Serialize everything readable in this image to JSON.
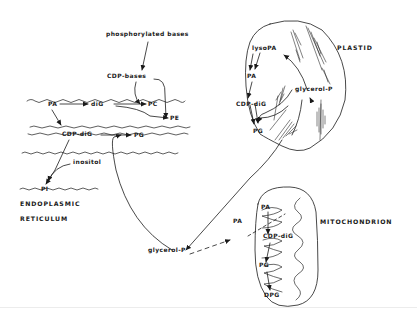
{
  "diagram": {
    "type": "biochemical pathway diagram",
    "compartments": {
      "er": {
        "label_line1": "ENDOPLASMIC",
        "label_line2": "RETICULUM"
      },
      "plastid": {
        "label": "PLASTID"
      },
      "mitochondrion": {
        "label": "MITOCHONDRION"
      }
    },
    "nodes": {
      "phosphorylated_bases": "phosphorylated bases",
      "cdp_bases": "CDP-bases",
      "er_pa": "PA",
      "er_dig": "diG",
      "er_pc": "PC",
      "er_pe": "PE",
      "er_cdp_dig": "CDP-diG",
      "er_pg": "PG",
      "inositol": "inositol",
      "er_pi": "PI",
      "plastid_lysopa": "lysoPA",
      "plastid_pa": "PA",
      "plastid_cdp_dig": "CDP-diG",
      "plastid_glycerol_p": "glycerol-P",
      "plastid_pg": "PG",
      "cyto_glycerol_p": "glycerol-P",
      "cyto_pa": "PA",
      "mito_pa": "PA",
      "mito_cdp_dig": "CDP-diG",
      "mito_pg": "PG",
      "mito_dpg": "DPG"
    },
    "edges": [
      {
        "from": "phosphorylated bases",
        "to": "CDP-bases"
      },
      {
        "from": "CDP-bases",
        "to": "PC"
      },
      {
        "from": "CDP-bases",
        "to": "PE"
      },
      {
        "from": "PA",
        "to": "diG",
        "compartment": "ER"
      },
      {
        "from": "diG",
        "to": "PC",
        "compartment": "ER"
      },
      {
        "from": "diG",
        "to": "PE",
        "compartment": "ER"
      },
      {
        "from": "PA",
        "to": "CDP-diG",
        "compartment": "ER"
      },
      {
        "from": "CDP-diG",
        "to": "PG",
        "compartment": "ER"
      },
      {
        "from": "CDP-diG",
        "to": "PI",
        "compartment": "ER"
      },
      {
        "from": "inositol",
        "to": "PI",
        "compartment": "ER"
      },
      {
        "from": "glycerol-P",
        "to": "PG",
        "compartment": "ER"
      },
      {
        "from": "lysoPA",
        "to": "PA",
        "compartment": "plastid"
      },
      {
        "from": "PA",
        "to": "CDP-diG",
        "compartment": "plastid"
      },
      {
        "from": "CDP-diG",
        "to": "PG",
        "compartment": "plastid"
      },
      {
        "from": "glycerol-P",
        "to": "lysoPA",
        "compartment": "plastid"
      },
      {
        "from": "glycerol-P",
        "to": "PG",
        "compartment": "plastid"
      },
      {
        "from": "glycerol-P",
        "to": "plastid glycerol-P"
      },
      {
        "from": "glycerol-P",
        "to": "PA",
        "style": "dashed"
      },
      {
        "from": "PA",
        "to": "mito PA",
        "style": "dashed"
      },
      {
        "from": "PA",
        "to": "CDP-diG",
        "compartment": "mitochondrion"
      },
      {
        "from": "CDP-diG",
        "to": "PG",
        "compartment": "mitochondrion"
      },
      {
        "from": "PG",
        "to": "DPG",
        "compartment": "mitochondrion"
      }
    ],
    "colors": {
      "ink": "#1a1a1a",
      "background": "#ffffff"
    }
  }
}
